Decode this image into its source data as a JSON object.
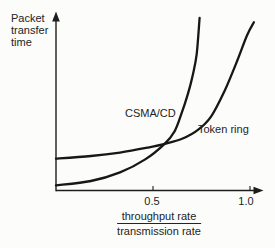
{
  "chart_data": {
    "type": "line",
    "title": "",
    "ylabel": "Packet transfer time",
    "ylabel_multiline": "Packet\ntransfer\ntime",
    "xlabel": "throughput rate / transmission rate",
    "xlabel_numerator": "throughput rate",
    "xlabel_denominator": "transmission rate",
    "xlim": [
      0,
      1.07
    ],
    "ylim": [
      0,
      10
    ],
    "grid": false,
    "legend_position": "inline-annotations",
    "x_ticks": [
      0.5,
      1.0
    ],
    "x_tick_labels": [
      "0.5",
      "1.0"
    ],
    "y_ticks": [],
    "series": [
      {
        "name": "CSMA/CD",
        "points": [
          [
            0,
            0.3
          ],
          [
            0.18,
            0.55
          ],
          [
            0.33,
            1.05
          ],
          [
            0.46,
            1.8
          ],
          [
            0.56,
            2.7
          ],
          [
            0.61,
            3.4
          ],
          [
            0.645,
            4.4
          ],
          [
            0.68,
            5.6
          ],
          [
            0.705,
            6.7
          ],
          [
            0.725,
            7.9
          ],
          [
            0.74,
            10.0
          ]
        ]
      },
      {
        "name": "Token ring",
        "points": [
          [
            0,
            1.85
          ],
          [
            0.18,
            2.0
          ],
          [
            0.33,
            2.2
          ],
          [
            0.48,
            2.5
          ],
          [
            0.56,
            2.7
          ],
          [
            0.65,
            3.0
          ],
          [
            0.73,
            3.5
          ],
          [
            0.8,
            4.3
          ],
          [
            0.87,
            5.8
          ],
          [
            0.935,
            7.55
          ],
          [
            0.985,
            9.0
          ],
          [
            1.02,
            9.75
          ]
        ]
      }
    ],
    "annotations": [
      {
        "text": "CSMA/CD",
        "near_series": "CSMA/CD"
      },
      {
        "text": "Token ring",
        "near_series": "Token ring"
      }
    ]
  }
}
